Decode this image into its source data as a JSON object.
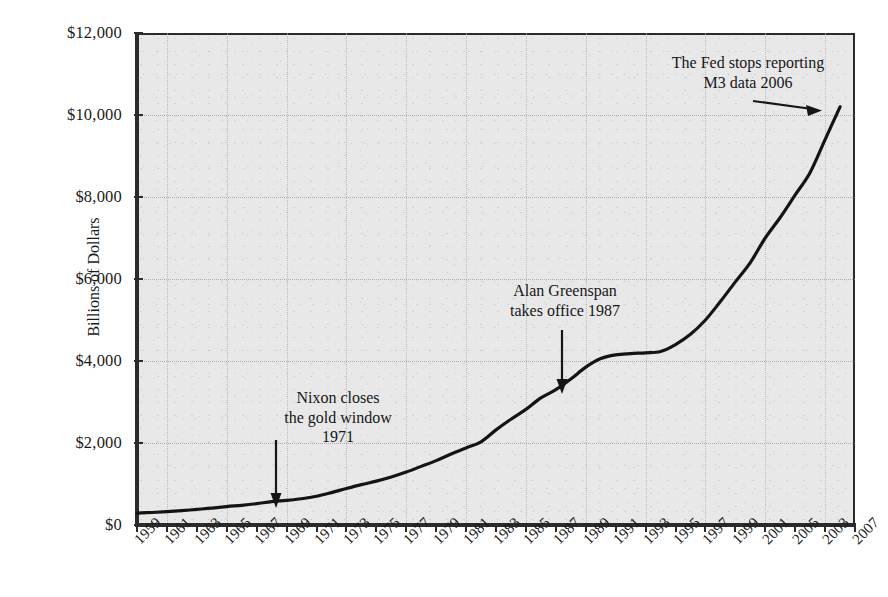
{
  "chart_data": {
    "type": "line",
    "title": "",
    "xlabel": "",
    "ylabel": "Billions of Dollars",
    "xlim": [
      1959,
      2007
    ],
    "ylim": [
      0,
      12000
    ],
    "grid": true,
    "legend": "none",
    "y_ticks": [
      {
        "value": 0,
        "label": "$0"
      },
      {
        "value": 2000,
        "label": "$2,000"
      },
      {
        "value": 4000,
        "label": "$4,000"
      },
      {
        "value": 6000,
        "label": "$6,000"
      },
      {
        "value": 8000,
        "label": "$8,000"
      },
      {
        "value": 10000,
        "label": "$10,000"
      },
      {
        "value": 12000,
        "label": "$12,000"
      }
    ],
    "x_tick_labels": [
      "1959",
      "1961",
      "1963",
      "1965",
      "1967",
      "1969",
      "1971",
      "1973",
      "1975",
      "1977",
      "1979",
      "1981",
      "1983",
      "1985",
      "1987",
      "1989",
      "1991",
      "1993",
      "1995",
      "1997",
      "1999",
      "2001",
      "2005",
      "2003",
      "2007"
    ],
    "series": [
      {
        "name": "M3 Money Supply",
        "color": "#141414",
        "x": [
          1959,
          1960,
          1961,
          1962,
          1963,
          1964,
          1965,
          1966,
          1967,
          1968,
          1969,
          1970,
          1971,
          1972,
          1973,
          1974,
          1975,
          1976,
          1977,
          1978,
          1979,
          1980,
          1981,
          1982,
          1983,
          1984,
          1985,
          1986,
          1987,
          1988,
          1989,
          1990,
          1991,
          1992,
          1993,
          1994,
          1995,
          1996,
          1997,
          1998,
          1999,
          2000,
          2001,
          2002,
          2003,
          2004,
          2005,
          2006
        ],
        "values": [
          292,
          305,
          325,
          350,
          380,
          410,
          450,
          480,
          520,
          570,
          600,
          640,
          700,
          790,
          890,
          985,
          1070,
          1170,
          1290,
          1430,
          1570,
          1730,
          1880,
          2030,
          2320,
          2580,
          2820,
          3100,
          3300,
          3560,
          3850,
          4060,
          4150,
          4180,
          4200,
          4230,
          4400,
          4650,
          5000,
          5450,
          5930,
          6400,
          7000,
          7500,
          8050,
          8600,
          9400,
          10200
        ]
      }
    ],
    "annotations": [
      {
        "id": "nixon",
        "lines": [
          "Nixon closes",
          "the gold window",
          "1971"
        ],
        "arrow": "down"
      },
      {
        "id": "greenspan",
        "lines": [
          "Alan Greenspan",
          "takes office 1987"
        ],
        "arrow": "down"
      },
      {
        "id": "fed",
        "lines": [
          "The Fed stops reporting",
          "M3 data 2006"
        ],
        "arrow": "right"
      }
    ]
  }
}
